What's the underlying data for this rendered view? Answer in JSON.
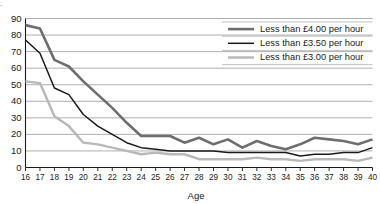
{
  "chart_data": {
    "type": "line",
    "title": "",
    "xlabel": "Age",
    "ylabel": "",
    "xlim": [
      16,
      40
    ],
    "ylim": [
      0,
      90
    ],
    "ytick_step": 10,
    "grid": true,
    "legend_position": "top-right",
    "x": [
      16,
      17,
      18,
      19,
      20,
      21,
      22,
      23,
      24,
      25,
      26,
      27,
      28,
      29,
      30,
      31,
      32,
      33,
      34,
      35,
      36,
      37,
      38,
      39,
      40
    ],
    "xticklabels": [
      "16",
      "17",
      "18",
      "19",
      "20",
      "21",
      "22",
      "23",
      "24",
      "25",
      "26",
      "27",
      "28",
      "29",
      "30",
      "31",
      "32",
      "33",
      "34",
      "35",
      "36",
      "37",
      "38",
      "39",
      "40"
    ],
    "yticklabels": [
      "0",
      "10",
      "20",
      "30",
      "40",
      "50",
      "60",
      "70",
      "80",
      "90"
    ],
    "series": [
      {
        "name": "Less than £4.00 per hour",
        "color": "#6e6e6e",
        "width": 2.6,
        "values": [
          86,
          84,
          65,
          61,
          52,
          44,
          36,
          27,
          19,
          19,
          19,
          15,
          18,
          14,
          17,
          12,
          16,
          13,
          11,
          14,
          18,
          17,
          16,
          14,
          17
        ]
      },
      {
        "name": "Less than £3.50 per hour",
        "color": "#1a1a1a",
        "width": 1.5,
        "values": [
          77,
          69,
          48,
          44,
          32,
          25,
          20,
          15,
          12,
          11,
          10,
          10,
          10,
          10,
          9,
          9,
          9,
          9,
          9,
          7,
          8,
          8,
          9,
          9,
          12
        ]
      },
      {
        "name": "Less than £3.00 per hour",
        "color": "#b8b8b8",
        "width": 2.4,
        "values": [
          52,
          51,
          31,
          25,
          15,
          14,
          12,
          10,
          8,
          9,
          8,
          8,
          5,
          5,
          5,
          5,
          6,
          5,
          5,
          4,
          5,
          5,
          5,
          4,
          6
        ]
      }
    ]
  },
  "legend": {
    "items": [
      {
        "label": "Less than £4.00 per hour"
      },
      {
        "label": "Less than £3.50 per hour"
      },
      {
        "label": "Less than £3.00 per hour"
      }
    ]
  },
  "axis": {
    "x_title": "Age"
  },
  "artifact": {
    "top_text_remnant": "."
  }
}
